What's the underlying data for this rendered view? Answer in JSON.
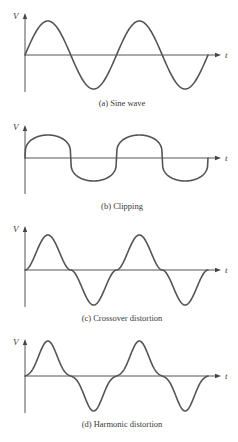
{
  "figure": {
    "axis_labels": {
      "y": "V",
      "x": "t"
    },
    "colors": {
      "line": "#555555",
      "text": "#3a3a3a",
      "background": "#ffffff"
    },
    "panels": [
      {
        "id": "a",
        "caption": "(a) Sine wave",
        "type": "sine",
        "baseline_y": 55,
        "amplitude": 34,
        "axis_top": 13,
        "axis_bottom": 92,
        "caption_y": 106,
        "label_y": 19
      },
      {
        "id": "b",
        "caption": "(b) Clipping",
        "type": "clipping",
        "baseline_y": 158,
        "amplitude": 23,
        "axis_top": 125,
        "axis_bottom": 194,
        "caption_y": 209,
        "label_y": 130
      },
      {
        "id": "c",
        "caption": "(c) Crossover distortion",
        "type": "crossover",
        "baseline_y": 270,
        "amplitude": 35,
        "axis_top": 226,
        "axis_bottom": 307,
        "caption_y": 321,
        "label_y": 232
      },
      {
        "id": "d",
        "caption": "(d) Harmonic distortion",
        "type": "harmonic",
        "baseline_y": 376,
        "amplitude": 35,
        "axis_top": 339,
        "axis_bottom": 413,
        "caption_y": 427,
        "label_y": 345
      }
    ],
    "geometry": {
      "x_start": 25,
      "x_end": 208,
      "axis_x_end": 221,
      "cycles": 2
    }
  }
}
